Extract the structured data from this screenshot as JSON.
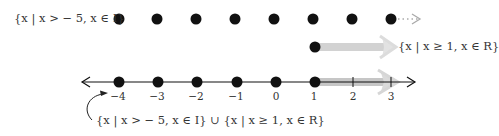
{
  "diagram": {
    "type": "number-line-set-union",
    "top_set": {
      "label": "{x | x > − 5, x ∈ I}",
      "points": [
        -4,
        -3,
        -2,
        -1,
        0,
        1,
        2,
        3
      ],
      "continues": "dotted-arrow-right"
    },
    "middle_set": {
      "label": "{x | x ≥ 1, x ∈ R}",
      "start": 1,
      "closed_endpoint": true,
      "direction": "right"
    },
    "number_line": {
      "tick_labels": [
        "−4",
        "−3",
        "−2",
        "−1",
        "0",
        "1",
        "2",
        "3"
      ],
      "ticks": [
        -4,
        -3,
        -2,
        -1,
        0,
        1,
        2,
        3
      ],
      "integer_dots": [
        -4,
        -3,
        -2,
        -1,
        0
      ],
      "shaded_from": 1,
      "arrows": "both-ends"
    },
    "union_label": "{x | x > − 5, x ∈ I}  ∪  {x | x ≥ 1, x ∈ R}"
  },
  "colors": {
    "ink": "#111111",
    "text": "#333333",
    "shade": "#c8c8c8",
    "shade_light": "#dedede"
  }
}
